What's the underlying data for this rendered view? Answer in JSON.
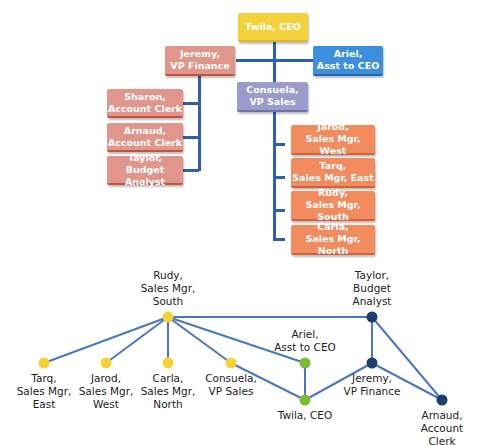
{
  "org_chart": {
    "ceo": "Twila, CEO",
    "vp_finance": "Jeremy,\nVP Finance",
    "asst_ceo": "Ariel,\nAsst to CEO",
    "vp_sales": "Consuela,\nVP Sales",
    "finance_staff": [
      "Sharon,\nAccount Clerk",
      "Arnaud,\nAccount Clerk",
      "Taylor,\nBudget Analyst"
    ],
    "sales_staff": [
      "Jarod,\nSales Mgr, West",
      "Tarq,\nSales Mgr, East",
      "Rudy,\nSales Mgr, South",
      "Carla,\nSales Mgr, North"
    ]
  },
  "network": {
    "colors": {
      "edge": "#4a78c0",
      "yellow": "#f5d334",
      "green": "#7dbb34",
      "navy": "#1d3d6e"
    },
    "nodes": [
      {
        "id": "rudy",
        "label": "Rudy,\nSales Mgr,\nSouth",
        "x": 168,
        "y": 317,
        "color": "yellow",
        "label_pos": "above"
      },
      {
        "id": "tarq",
        "label": "Tarq,\nSales Mgr,\nEast",
        "x": 44,
        "y": 363,
        "color": "yellow",
        "label_pos": "below"
      },
      {
        "id": "jarod",
        "label": "Jarod,\nSales Mgr,\nWest",
        "x": 106,
        "y": 363,
        "color": "yellow",
        "label_pos": "below"
      },
      {
        "id": "carla",
        "label": "Carla,\nSales Mgr,\nNorth",
        "x": 168,
        "y": 363,
        "color": "yellow",
        "label_pos": "below"
      },
      {
        "id": "consuela",
        "label": "Consuela,\nVP Sales",
        "x": 231,
        "y": 363,
        "color": "yellow",
        "label_pos": "below"
      },
      {
        "id": "ariel",
        "label": "Ariel,\nAsst to CEO",
        "x": 305,
        "y": 363,
        "color": "green",
        "label_pos": "above"
      },
      {
        "id": "twila",
        "label": "Twila, CEO",
        "x": 305,
        "y": 400,
        "color": "green",
        "label_pos": "below"
      },
      {
        "id": "taylor",
        "label": "Taylor,\nBudget\nAnalyst",
        "x": 372,
        "y": 317,
        "color": "navy",
        "label_pos": "above"
      },
      {
        "id": "jeremy",
        "label": "Jeremy,\nVP Finance",
        "x": 372,
        "y": 363,
        "color": "navy",
        "label_pos": "below"
      },
      {
        "id": "arnaud",
        "label": "Arnaud,\nAccount Clerk",
        "x": 442,
        "y": 400,
        "color": "navy",
        "label_pos": "below"
      }
    ],
    "edges": [
      [
        "rudy",
        "tarq"
      ],
      [
        "rudy",
        "jarod"
      ],
      [
        "rudy",
        "carla"
      ],
      [
        "rudy",
        "consuela"
      ],
      [
        "rudy",
        "ariel"
      ],
      [
        "rudy",
        "taylor"
      ],
      [
        "consuela",
        "twila"
      ],
      [
        "ariel",
        "twila"
      ],
      [
        "twila",
        "jeremy"
      ],
      [
        "taylor",
        "jeremy"
      ],
      [
        "taylor",
        "arnaud"
      ],
      [
        "jeremy",
        "arnaud"
      ]
    ]
  }
}
